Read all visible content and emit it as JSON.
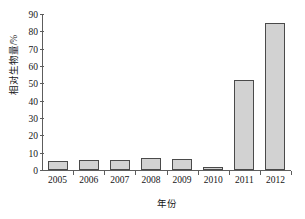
{
  "chart_data": {
    "type": "bar",
    "title": "",
    "xlabel": "年份",
    "ylabel": "相对生物量/%",
    "categories": [
      "2005",
      "2006",
      "2007",
      "2008",
      "2009",
      "2010",
      "2011",
      "2012"
    ],
    "values": [
      5,
      6,
      6,
      7,
      6.5,
      2,
      52,
      85
    ],
    "ylim": [
      0,
      90
    ],
    "yticks": [
      0,
      10,
      20,
      30,
      40,
      50,
      60,
      70,
      80,
      90
    ],
    "ytick_labels": [
      "0",
      "10",
      "20",
      "30",
      "40",
      "50",
      "60",
      "70",
      "80",
      "90"
    ],
    "grid": false,
    "legend": "none",
    "bar_fill_color": "#d2d2d2",
    "bar_border_color": "#4a4a4a",
    "axis_color": "#5d5d5d",
    "background_color": "#ffffff"
  }
}
